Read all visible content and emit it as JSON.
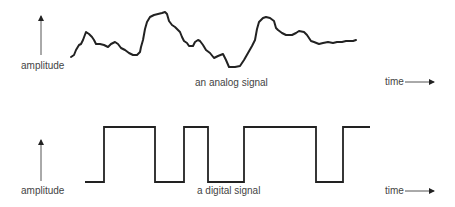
{
  "analog": {
    "y_label": "amplitude",
    "x_label": "time",
    "caption": "an analog signal",
    "points": [
      [
        71,
        57
      ],
      [
        74,
        55
      ],
      [
        76,
        50
      ],
      [
        79,
        45
      ],
      [
        81,
        44
      ],
      [
        83,
        40
      ],
      [
        86,
        32
      ],
      [
        89,
        34
      ],
      [
        92,
        37
      ],
      [
        94,
        40
      ],
      [
        96,
        44
      ],
      [
        100,
        44
      ],
      [
        104,
        45
      ],
      [
        108,
        47
      ],
      [
        111,
        44
      ],
      [
        115,
        42
      ],
      [
        118,
        44
      ],
      [
        121,
        48
      ],
      [
        125,
        50
      ],
      [
        129,
        53
      ],
      [
        133,
        55
      ],
      [
        137,
        55
      ],
      [
        140,
        52
      ],
      [
        141,
        47
      ],
      [
        143,
        40
      ],
      [
        145,
        29
      ],
      [
        147,
        22
      ],
      [
        150,
        17
      ],
      [
        154,
        15
      ],
      [
        158,
        14
      ],
      [
        162,
        13
      ],
      [
        165,
        12
      ],
      [
        167,
        14
      ],
      [
        169,
        21
      ],
      [
        172,
        25
      ],
      [
        175,
        27
      ],
      [
        178,
        30
      ],
      [
        180,
        32
      ],
      [
        182,
        37
      ],
      [
        184,
        41
      ],
      [
        187,
        43
      ],
      [
        189,
        46
      ],
      [
        193,
        46
      ],
      [
        195,
        42
      ],
      [
        198,
        40
      ],
      [
        200,
        41
      ],
      [
        203,
        45
      ],
      [
        206,
        50
      ],
      [
        210,
        53
      ],
      [
        214,
        58
      ],
      [
        218,
        56
      ],
      [
        223,
        54
      ],
      [
        226,
        60
      ],
      [
        229,
        67
      ],
      [
        235,
        67
      ],
      [
        240,
        66
      ],
      [
        244,
        60
      ],
      [
        248,
        53
      ],
      [
        252,
        46
      ],
      [
        255,
        40
      ],
      [
        257,
        29
      ],
      [
        259,
        22
      ],
      [
        263,
        18
      ],
      [
        266,
        17
      ],
      [
        270,
        18
      ],
      [
        274,
        21
      ],
      [
        276,
        28
      ],
      [
        278,
        30
      ],
      [
        282,
        33
      ],
      [
        286,
        35
      ],
      [
        292,
        35
      ],
      [
        296,
        33
      ],
      [
        299,
        31
      ],
      [
        304,
        32
      ],
      [
        307,
        35
      ],
      [
        311,
        41
      ],
      [
        314,
        42
      ],
      [
        319,
        44
      ],
      [
        323,
        43
      ],
      [
        328,
        42
      ],
      [
        333,
        43
      ],
      [
        337,
        42
      ],
      [
        342,
        42
      ],
      [
        346,
        41
      ],
      [
        350,
        41
      ],
      [
        353,
        41
      ],
      [
        356,
        40
      ]
    ]
  },
  "digital": {
    "y_label": "amplitude",
    "x_label": "time",
    "caption": "a digital signal",
    "high_y": 127,
    "low_y": 182,
    "edges_x": [
      85,
      104,
      155,
      184,
      208,
      244,
      316,
      343,
      370
    ],
    "start_level": "low"
  }
}
